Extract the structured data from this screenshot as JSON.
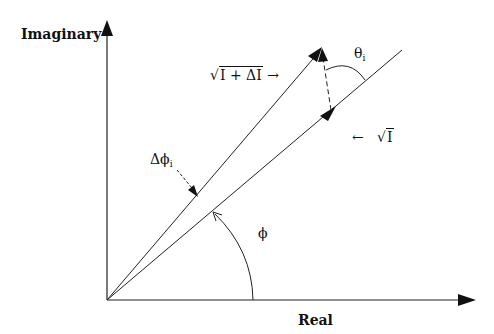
{
  "diagram": {
    "type": "phasor-diagram",
    "axes": {
      "x_label": "Real",
      "y_label": "Imaginary"
    },
    "vectors": {
      "resultant": {
        "label_radicand": "I + ΔI",
        "label_arrow": "→"
      },
      "reference": {
        "label_radicand": "I",
        "label_arrow": "←"
      }
    },
    "angles": {
      "phi": "ϕ",
      "delta_phi": "Δϕ",
      "delta_phi_sub": "i",
      "theta": "θ",
      "theta_sub": "i"
    },
    "sqrt_symbol": "√",
    "colors": {
      "ink": "#111111",
      "background": "#ffffff"
    }
  }
}
